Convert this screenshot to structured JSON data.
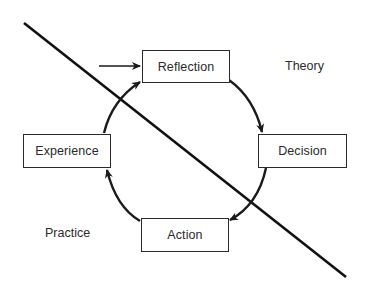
{
  "diagram": {
    "type": "cycle",
    "nodes": [
      {
        "id": "reflection",
        "label": "Reflection"
      },
      {
        "id": "decision",
        "label": "Decision"
      },
      {
        "id": "action",
        "label": "Action"
      },
      {
        "id": "experience",
        "label": "Experience"
      }
    ],
    "edges": [
      {
        "from": "reflection",
        "to": "decision"
      },
      {
        "from": "decision",
        "to": "action"
      },
      {
        "from": "action",
        "to": "experience"
      },
      {
        "from": "experience",
        "to": "reflection"
      }
    ],
    "entry_arrow_target": "reflection",
    "regions": {
      "theory": "Theory",
      "practice": "Practice"
    },
    "divider": "diagonal line separating Theory (upper right) from Practice (lower left)"
  }
}
